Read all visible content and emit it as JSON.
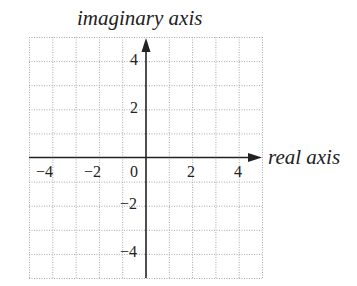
{
  "diagram": {
    "type": "complex-plane",
    "y_axis_title": "imaginary axis",
    "x_axis_title": "real axis",
    "grid": {
      "columns": 10,
      "rows": 10,
      "x_range": [
        -5,
        5
      ],
      "y_range": [
        -5,
        5
      ],
      "step": 1,
      "style": "dotted"
    },
    "x_tick_labels": [
      "−4",
      "−2",
      "0",
      "2",
      "4"
    ],
    "y_tick_labels_positive": [
      "4",
      "2"
    ],
    "y_tick_labels_negative": [
      "−2",
      "−4"
    ],
    "colors": {
      "axis": "#222222",
      "grid": "#9a9a9a",
      "text": "#222222"
    }
  }
}
